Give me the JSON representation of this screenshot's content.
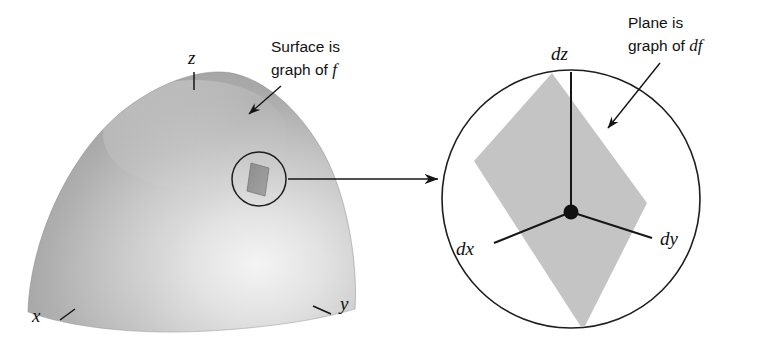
{
  "figure": {
    "background_color": "#ffffff",
    "ink_color": "#161616",
    "width": 771,
    "height": 342
  },
  "left_panel": {
    "name": "surface-dome",
    "callout": {
      "line1": "Surface is",
      "line2_prefix": "graph of ",
      "line2_math": "f"
    },
    "axes": [
      {
        "key": "z",
        "label": "z"
      },
      {
        "key": "x",
        "label": "x"
      },
      {
        "key": "y",
        "label": "y"
      }
    ],
    "surface_colors": {
      "highlight": "#f2f2f2",
      "mid": "#bdbdbd",
      "shadow": "#8c8c8c"
    },
    "magnifier": {
      "name": "surface-patch-circle",
      "patch_color": "#8a8a8a"
    }
  },
  "connector": {
    "name": "zoom-connector-arrow",
    "label": ""
  },
  "right_panel": {
    "name": "tangent-plane-inset",
    "callout": {
      "line1": "Plane is",
      "line2_prefix": "graph of ",
      "line2_math": "df"
    },
    "axes": [
      {
        "key": "dz",
        "label": "dz"
      },
      {
        "key": "dx",
        "label": "dx"
      },
      {
        "key": "dy",
        "label": "dy"
      }
    ],
    "plane_color": "#c3c3c3",
    "origin_dot_color": "#111111"
  }
}
